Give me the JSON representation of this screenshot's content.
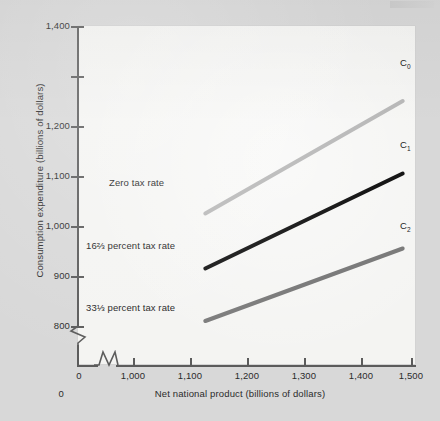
{
  "figure": {
    "background_color": "#d8d8d8",
    "panel_color": "#f4f4f2"
  },
  "chart_data": {
    "type": "line",
    "title": "",
    "xlabel": "Net national product (billions of dollars)",
    "ylabel": "Consumption expenditure (billions of dollars)",
    "xlim": [
      950,
      1520
    ],
    "ylim": [
      780,
      1400
    ],
    "xticks": [
      "0",
      "1,000",
      "1,100",
      "1,200",
      "1,300",
      "1,400",
      "1,500"
    ],
    "xtick_values": [
      0,
      1000,
      1100,
      1200,
      1300,
      1400,
      1500
    ],
    "yticks": [
      "800",
      "900",
      "1,000",
      "1,100",
      "1,200",
      "1,400"
    ],
    "ytick_values": [
      800,
      900,
      1000,
      1100,
      1200,
      1400
    ],
    "grid": false,
    "legend": "none",
    "axis_breaks": {
      "x": "between 0 and 1,000",
      "y": "below 800"
    },
    "series": [
      {
        "name": "C0",
        "label": "C",
        "subscript": "0",
        "annotation": "Zero tax rate",
        "color": "#b9b9b9",
        "x": [
          1130,
          1485
        ],
        "values": [
          1025,
          1250
        ]
      },
      {
        "name": "C1",
        "label": "C",
        "subscript": "1",
        "annotation": "16⅔ percent tax rate",
        "color": "#161616",
        "x": [
          1130,
          1485
        ],
        "values": [
          915,
          1105
        ]
      },
      {
        "name": "C2",
        "label": "C",
        "subscript": "2",
        "annotation": "33⅓ percent tax rate",
        "color": "#7b7b7b",
        "x": [
          1130,
          1485
        ],
        "values": [
          810,
          955
        ]
      }
    ]
  },
  "annotations": {
    "zero_tax_rate": "Zero tax rate",
    "sixteen_two_thirds": "16⅔ percent tax rate",
    "thirty_three_one_third": "33⅓ percent tax rate"
  },
  "curve_labels": {
    "c0": "C",
    "c0_sub": "0",
    "c1": "C",
    "c1_sub": "1",
    "c2": "C",
    "c2_sub": "2"
  },
  "axis_titles": {
    "x": "Net national product (billions of dollars)",
    "y": "Consumption expenditure (billions of dollars)"
  },
  "y_tick_labels": {
    "t1400": "1,400",
    "t1200": "1,200",
    "t1100": "1,100",
    "t1000": "1,000",
    "t900": "900",
    "t800": "800",
    "t0": "0"
  },
  "x_tick_labels": {
    "t0": "0",
    "t1000": "1,000",
    "t1100": "1,100",
    "t1200": "1,200",
    "t1300": "1,300",
    "t1400": "1,400",
    "t1500": "1,500"
  }
}
